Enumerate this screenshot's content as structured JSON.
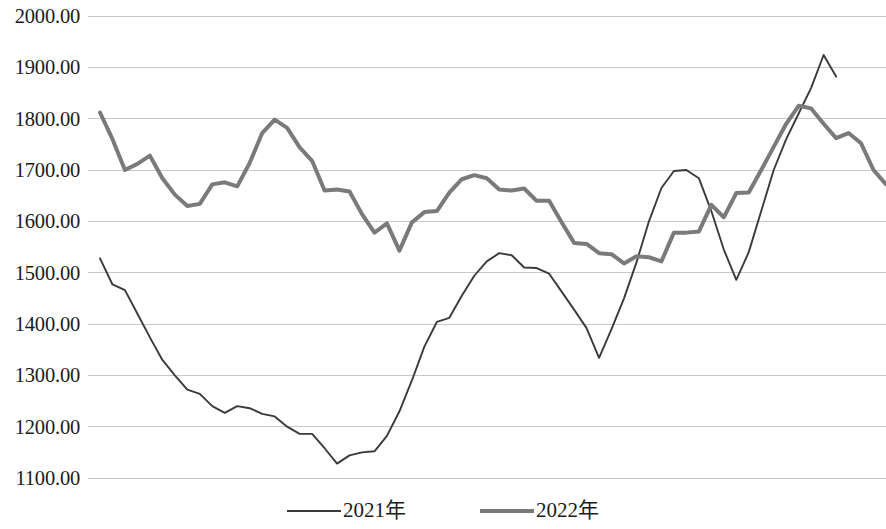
{
  "chart_data": {
    "type": "line",
    "title": "",
    "subtitle": "",
    "xlabel": "",
    "ylabel": "",
    "ylim": [
      1100,
      2000
    ],
    "yticks": [
      2000,
      1900,
      1800,
      1700,
      1600,
      1500,
      1400,
      1300,
      1200,
      1100
    ],
    "ytick_labels": [
      "2000.00",
      "1900.00",
      "1800.00",
      "1700.00",
      "1600.00",
      "1500.00",
      "1400.00",
      "1300.00",
      "1200.00",
      "1100.00"
    ],
    "grid": true,
    "grid_color": "#c8c8cc",
    "xticks": [],
    "xtick_labels": [],
    "legend_position": "bottom",
    "x": [
      1,
      2,
      3,
      4,
      5,
      6,
      7,
      8,
      9,
      10,
      11,
      12,
      13,
      14,
      15,
      16,
      17,
      18,
      19,
      20,
      21,
      22,
      23,
      24,
      25,
      26,
      27,
      28,
      29,
      30,
      31,
      32,
      33,
      34,
      35,
      36,
      37,
      38,
      39,
      40,
      41,
      42,
      43,
      44,
      45,
      46,
      47,
      48,
      49,
      50,
      51,
      52
    ],
    "series": [
      {
        "name": "2021年",
        "color": "#3a3a3a",
        "width": 1.9,
        "values": [
          1528,
          1477,
          1466,
          1420,
          1374,
          1330,
          1300,
          1272,
          1264,
          1240,
          1227,
          1240,
          1236,
          1225,
          1220,
          1200,
          1186,
          1186,
          1158,
          1128,
          1144,
          1150,
          1152,
          1182,
          1230,
          1290,
          1356,
          1404,
          1412,
          1455,
          1494,
          1522,
          1538,
          1534,
          1510,
          1509,
          1498,
          1463,
          1428,
          1392,
          1334,
          1390,
          1450,
          1520,
          1600,
          1665,
          1698,
          1700,
          1684,
          1620,
          1545,
          1486
        ]
      },
      {
        "name": "2022年",
        "color": "#7a7a7a",
        "width": 4.0,
        "values": [
          1812,
          1760,
          1700,
          1712,
          1728,
          1684,
          1652,
          1630,
          1634,
          1672,
          1676,
          1668,
          1714,
          1772,
          1798,
          1782,
          1744,
          1718,
          1660,
          1662,
          1658,
          1614,
          1578,
          1596,
          1543,
          1598,
          1618,
          1620,
          1656,
          1682,
          1690,
          1684,
          1662,
          1660,
          1664,
          1640,
          1640,
          1598,
          1558,
          1556,
          1538,
          1536,
          1518,
          1532,
          1530,
          1522,
          1578,
          1578,
          1580,
          1632,
          1608,
          1655
        ]
      }
    ],
    "series_extended": {
      "note_2021_tail": [
        1486,
        1540,
        1620,
        1700,
        1760,
        1810,
        1860,
        1924,
        1882
      ],
      "note_2022_tail": [
        1655,
        1656,
        1700,
        1745,
        1790,
        1825,
        1820,
        1790,
        1762,
        1772,
        1752,
        1700,
        1672
      ]
    }
  },
  "legend": {
    "items": [
      {
        "label": "2021年",
        "style": "s2021"
      },
      {
        "label": "2022年",
        "style": "s2022"
      }
    ]
  },
  "axis": {
    "y_labels": [
      "2000.00",
      "1900.00",
      "1800.00",
      "1700.00",
      "1600.00",
      "1500.00",
      "1400.00",
      "1300.00",
      "1200.00",
      "1100.00"
    ]
  }
}
